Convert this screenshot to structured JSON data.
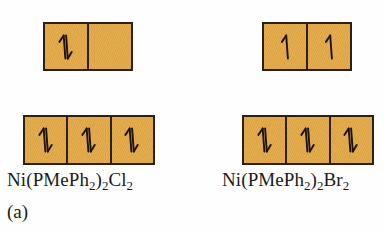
{
  "figure": {
    "caption": "(a)",
    "box_fill_color": "#E2A846",
    "box_border_color": "#2B2014",
    "arrow_color": "#1A1208",
    "background_color": "#FEFEFE"
  },
  "diagrams": [
    {
      "id": "left",
      "label_parts": [
        {
          "text": "Ni(PMePh",
          "sub": false
        },
        {
          "text": "2",
          "sub": true
        },
        {
          "text": ")",
          "sub": false
        },
        {
          "text": "2",
          "sub": true
        },
        {
          "text": "Cl",
          "sub": false
        },
        {
          "text": "2",
          "sub": true
        }
      ],
      "label_plain": "Ni(PMePh2)2Cl2",
      "upper_row": {
        "name": "upper-orbital-row",
        "box_count": 2,
        "occupancy": [
          "paired",
          "empty"
        ]
      },
      "lower_row": {
        "name": "lower-orbital-row",
        "box_count": 3,
        "occupancy": [
          "paired",
          "paired",
          "paired"
        ]
      }
    },
    {
      "id": "right",
      "label_parts": [
        {
          "text": "Ni(PMePh",
          "sub": false
        },
        {
          "text": "2",
          "sub": true
        },
        {
          "text": ")",
          "sub": false
        },
        {
          "text": "2",
          "sub": true
        },
        {
          "text": "Br",
          "sub": false
        },
        {
          "text": "2",
          "sub": true
        }
      ],
      "label_plain": "Ni(PMePh2)2Br2",
      "upper_row": {
        "name": "upper-orbital-row",
        "box_count": 2,
        "occupancy": [
          "up",
          "up"
        ]
      },
      "lower_row": {
        "name": "lower-orbital-row",
        "box_count": 3,
        "occupancy": [
          "paired",
          "paired",
          "paired"
        ]
      }
    }
  ],
  "labels": {
    "left_complex": "Ni(PMePh2)2Cl2",
    "right_complex": "Ni(PMePh2)2Br2",
    "caption": "(a)"
  },
  "icon_names": {
    "paired": "up-down-spin-pair-icon",
    "up": "up-spin-arrow-icon",
    "empty": "empty-orbital-icon"
  }
}
